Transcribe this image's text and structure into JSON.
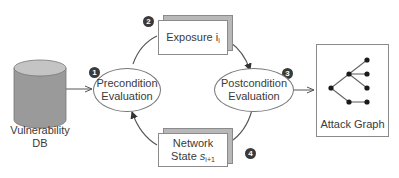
{
  "diagram": {
    "type": "process-cycle",
    "nodes": {
      "vulnerability_db": {
        "label_line1": "Vulnerability",
        "label_line2": "DB",
        "shape": "cylinder"
      },
      "precondition": {
        "step": "1",
        "label_line1": "Precondition",
        "label_line2": "Evaluation",
        "shape": "ellipse"
      },
      "exposure": {
        "step": "2",
        "label": "Exposure i",
        "subscript": "i",
        "shape": "stacked-card"
      },
      "postcondition": {
        "step": "3",
        "label_line1": "Postcondition",
        "label_line2": "Evaluation",
        "shape": "ellipse"
      },
      "network_state": {
        "step": "4",
        "label_line1": "Network",
        "label_line2": "State s",
        "subscript": "i+1",
        "shape": "stacked-card"
      },
      "attack_graph": {
        "label": "Attack Graph",
        "shape": "box-with-tree"
      }
    },
    "edges": [
      {
        "from": "vulnerability_db",
        "to": "precondition"
      },
      {
        "from": "precondition",
        "to": "exposure"
      },
      {
        "from": "exposure",
        "to": "postcondition"
      },
      {
        "from": "postcondition",
        "to": "network_state"
      },
      {
        "from": "network_state",
        "to": "precondition"
      },
      {
        "from": "postcondition",
        "to": "attack_graph"
      }
    ],
    "colors": {
      "cylinder_body": "#9a9a9a",
      "cylinder_top": "#c4c4c4",
      "badge": "#3a3a3a",
      "line": "#555555",
      "card_back": "#b8b8b8"
    }
  }
}
